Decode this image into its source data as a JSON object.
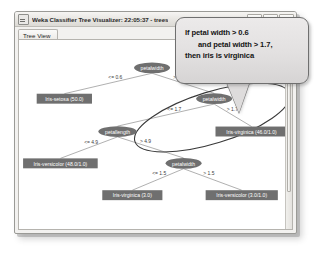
{
  "window": {
    "title": "Weka Classifier Tree Visualizer: 22:05:37 - trees",
    "icon": "weka-window-icon",
    "buttons": {
      "minimize": "minimize-icon",
      "maximize": "maximize-icon",
      "close": "close-icon"
    }
  },
  "tab": {
    "label": "Tree View"
  },
  "callout": {
    "line1": "If petal width > 0.6",
    "line2": "and petal width > 1.7,",
    "line3": "then iris is virginica"
  },
  "colors": {
    "node_fill": "#6f6f6f",
    "leaf_fill": "#6f6f6f",
    "edge_stroke": "#8d8d8d",
    "annotation_stroke": "#3a3a3a",
    "callout_fill": "#e2e0e0",
    "text_on_node": "#ffffff"
  },
  "tree": {
    "nodes": [
      {
        "id": "n0",
        "type": "split",
        "label": "petalwidth",
        "x": 135,
        "y": 28
      },
      {
        "id": "n1",
        "type": "leaf",
        "label": "Iris-setosa (50.0)",
        "x": 46,
        "y": 59
      },
      {
        "id": "n2",
        "type": "split",
        "label": "petalwidth",
        "x": 198,
        "y": 59
      },
      {
        "id": "n3",
        "type": "split",
        "label": "petallength",
        "x": 100,
        "y": 92
      },
      {
        "id": "n4",
        "type": "leaf",
        "label": "Iris-virginica (46.0/1.0)",
        "x": 236,
        "y": 92
      },
      {
        "id": "n5",
        "type": "leaf",
        "label": "Iris-versicolor (48.0/1.0)",
        "x": 42,
        "y": 124
      },
      {
        "id": "n6",
        "type": "split",
        "label": "petalwidth",
        "x": 167,
        "y": 124
      },
      {
        "id": "n7",
        "type": "leaf",
        "label": "Iris-virginica (3.0)",
        "x": 115,
        "y": 156
      },
      {
        "id": "n8",
        "type": "leaf",
        "label": "Iris-versicolor (3.0/1.0)",
        "x": 226,
        "y": 156
      }
    ],
    "edges": [
      {
        "from": "n0",
        "to": "n1",
        "label": "<= 0.6"
      },
      {
        "from": "n0",
        "to": "n2",
        "label": "> 0.6"
      },
      {
        "from": "n2",
        "to": "n3",
        "label": "<= 1.7"
      },
      {
        "from": "n2",
        "to": "n4",
        "label": "> 1.7"
      },
      {
        "from": "n3",
        "to": "n5",
        "label": "<= 4.9"
      },
      {
        "from": "n3",
        "to": "n6",
        "label": "> 4.9"
      },
      {
        "from": "n6",
        "to": "n7",
        "label": "<= 1.5"
      },
      {
        "from": "n6",
        "to": "n8",
        "label": "> 1.5"
      }
    ],
    "annotation": {
      "name": "highlight-ellipse",
      "cx": 196,
      "cy": 78,
      "rx": 82,
      "ry": 26,
      "rotate": -17
    }
  }
}
